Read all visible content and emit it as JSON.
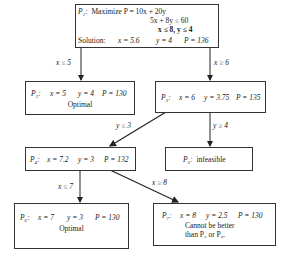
{
  "diagram": {
    "type": "branch-and-bound tree",
    "nodes": {
      "p1": {
        "id": "P₁:",
        "line1": "Maximize P = 10x + 20y",
        "line2": "5x +  8y ≤ 60",
        "line3": "x ≤ 8, y ≤ 4",
        "solution_label": "Solution:",
        "x": "x = 5.6",
        "y": "y = 4",
        "p": "P = 136"
      },
      "p2": {
        "id": "P₂:",
        "x": "x = 5",
        "y": "y = 4",
        "p": "P = 130",
        "note": "Optimal"
      },
      "p3": {
        "id": "P₃:",
        "x": "x = 6",
        "y": "y = 3.75",
        "p": "P = 135"
      },
      "p4": {
        "id": "P₄:",
        "x": "x = 7.2",
        "y": "y = 3",
        "p": "P = 132"
      },
      "p5": {
        "id": "P₅:",
        "note": "infeasible"
      },
      "p6": {
        "id": "P₆:",
        "x": "x = 7",
        "y": "y = 3",
        "p": "P = 130",
        "note": "Optimal"
      },
      "p7": {
        "id": "P₇:",
        "x": "x = 8",
        "y": "y = 2.5",
        "p": "P = 130",
        "note1": "Cannot be better",
        "note2": "than P₂ or P₆."
      }
    },
    "edges": {
      "p1_p2": "x ≤ 5",
      "p1_p3": "x ≥ 6",
      "p3_p4": "y ≤ 3",
      "p3_p5": "y ≥ 4",
      "p4_p6": "x ≤ 7",
      "p4_p7": "x ≥ 8"
    }
  }
}
